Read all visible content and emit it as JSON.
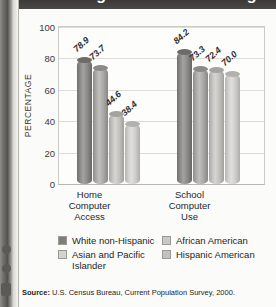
{
  "title": "Percentage of Children Using Computers by Race/Ethnicity, 2000",
  "source": {
    "label": "Source:",
    "text": "U.S. Census Bureau, Current Population Survey, 2000."
  },
  "legend": {
    "items": [
      {
        "label": "White non-Hispanic",
        "swatch": "s-dark"
      },
      {
        "label": "African American",
        "swatch": "s-light"
      },
      {
        "label": "Asian and Pacific Islander",
        "swatch": "s-mid"
      },
      {
        "label": "Hispanic American",
        "swatch": "s-pale"
      }
    ]
  },
  "chart_data": {
    "type": "bar",
    "title": "Percentage of Children Using Computers by Race/Ethnicity, 2000",
    "xlabel": "",
    "ylabel": "PERCENTAGE",
    "ylim": [
      0,
      100
    ],
    "yticks": [
      100,
      80,
      60,
      40,
      20,
      0
    ],
    "grid": true,
    "legend_position": "bottom",
    "categories": [
      "Home Computer Access",
      "School Computer Use"
    ],
    "category_lines": [
      [
        "Home",
        "Computer",
        "Access"
      ],
      [
        "School",
        "Computer",
        "Use"
      ]
    ],
    "series": [
      {
        "name": "White non-Hispanic",
        "values": [
          78.9,
          84.2
        ],
        "labels": [
          "78.9",
          "84.2"
        ]
      },
      {
        "name": "African American",
        "values": [
          73.7,
          73.3
        ],
        "labels": [
          "73.7",
          "73.3"
        ]
      },
      {
        "name": "Asian and Pacific Islander",
        "values": [
          44.6,
          72.4
        ],
        "labels": [
          "44.6",
          "72.4"
        ]
      },
      {
        "name": "Hispanic American",
        "values": [
          38.4,
          70.0
        ],
        "labels": [
          "38.4",
          "70.0"
        ]
      }
    ]
  }
}
